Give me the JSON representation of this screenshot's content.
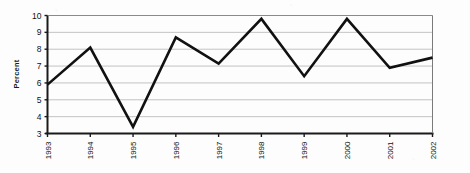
{
  "chart_data": {
    "type": "line",
    "title": "",
    "xlabel": "",
    "ylabel": "Percent",
    "categories": [
      "1993",
      "1994",
      "1995",
      "1996",
      "1997",
      "1998",
      "1999",
      "2000",
      "2001",
      "2002"
    ],
    "values": [
      5.9,
      8.1,
      3.4,
      8.7,
      7.15,
      9.8,
      6.4,
      9.8,
      6.9,
      7.5
    ],
    "series": [
      {
        "name": "Percent",
        "values": [
          5.9,
          8.1,
          3.4,
          8.7,
          7.15,
          9.8,
          6.4,
          9.8,
          6.9,
          7.5
        ]
      }
    ],
    "ylim": [
      3,
      10
    ],
    "yticks": [
      3,
      4,
      5,
      6,
      7,
      8,
      9,
      10
    ],
    "ytick_labels": [
      "3",
      "4",
      "5",
      "6",
      "7",
      "8",
      "9",
      "10"
    ],
    "xtick_labels": [
      "1993",
      "1994",
      "1995",
      "1996",
      "1997",
      "1998",
      "1999",
      "2000",
      "2001",
      "2002"
    ],
    "grid": true,
    "grid_axis": "y",
    "legend": "none",
    "line_color": "#111111",
    "grid_color": "#bcbcbc",
    "axis_color": "#1a1a1a",
    "xtick_rotation": -90
  }
}
